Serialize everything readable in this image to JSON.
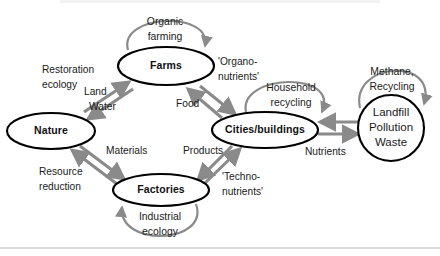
{
  "diagram": {
    "type": "cycle-flow-diagram",
    "colors": {
      "node_stroke": "#000000",
      "arrow_gray": "#8a8a8a",
      "loop_gray": "#8a8a8a",
      "text": "#1a1a1a",
      "background": "#ffffff",
      "rule": "#b5b5b5"
    },
    "nodes": [
      {
        "id": "nature",
        "label": "Nature",
        "shape": "ellipse",
        "bold": true,
        "cx": 51,
        "cy": 131,
        "rx": 44,
        "ry": 18
      },
      {
        "id": "farms",
        "label": "Farms",
        "shape": "ellipse",
        "bold": true,
        "cx": 166,
        "cy": 66,
        "rx": 48,
        "ry": 19
      },
      {
        "id": "cities",
        "label": "Cities/buildings",
        "shape": "ellipse",
        "bold": true,
        "cx": 265,
        "cy": 130,
        "rx": 53,
        "ry": 18
      },
      {
        "id": "factories",
        "label": "Factories",
        "shape": "ellipse",
        "bold": true,
        "cx": 161,
        "cy": 190,
        "rx": 48,
        "ry": 16
      },
      {
        "id": "landfill",
        "label": "Landfill Pollution Waste",
        "shape": "circle",
        "bold": false,
        "cx": 391,
        "cy": 128,
        "rx": 34,
        "ry": 30,
        "lines": [
          "Landfill",
          "Pollution",
          "Waste"
        ]
      }
    ],
    "self_loops": [
      {
        "id": "organic-farming",
        "target": "farms",
        "lines": [
          "Organic",
          "farming"
        ],
        "cx": 165,
        "cy": 27
      },
      {
        "id": "household-recycling",
        "target": "cities",
        "lines": [
          "Household",
          "recycling"
        ],
        "cx": 290,
        "cy": 93
      },
      {
        "id": "methane-recycling",
        "target": "landfill",
        "lines": [
          "Methane,",
          "Recycling"
        ],
        "cx": 390,
        "cy": 78
      },
      {
        "id": "industrial-ecology",
        "target": "factories",
        "lines": [
          "Industrial",
          "ecology"
        ],
        "cx": 160,
        "cy": 222
      }
    ],
    "edges": [
      {
        "id": "nature-farms",
        "from": "nature",
        "to": "farms",
        "direction": "both",
        "labels": [
          "Restoration ecology",
          "Land",
          "Water"
        ]
      },
      {
        "id": "farms-cities",
        "from": "farms",
        "to": "cities",
        "direction": "both",
        "labels": [
          "'Organo-nutrients'",
          "Food"
        ]
      },
      {
        "id": "nature-factories",
        "from": "nature",
        "to": "factories",
        "direction": "both",
        "labels": [
          "Materials",
          "Resource reduction"
        ]
      },
      {
        "id": "factories-cities",
        "from": "factories",
        "to": "cities",
        "direction": "both",
        "labels": [
          "Products",
          "'Techno-nutrients'"
        ]
      },
      {
        "id": "cities-landfill",
        "from": "cities",
        "to": "landfill",
        "direction": "both",
        "labels": [
          "Nutrients"
        ]
      }
    ],
    "edge_labels": [
      {
        "id": "restoration-ecology",
        "lines": [
          "Restoration",
          "ecology"
        ],
        "x": 42,
        "y": 70,
        "anchor": "start"
      },
      {
        "id": "land",
        "lines": [
          "Land"
        ],
        "x": 82,
        "y": 89,
        "anchor": "start"
      },
      {
        "id": "water",
        "lines": [
          "Water"
        ],
        "x": 86,
        "y": 104,
        "anchor": "start"
      },
      {
        "id": "organo-nutrients",
        "lines": [
          "'Organo-",
          "nutrients'"
        ],
        "x": 219,
        "y": 64,
        "anchor": "start"
      },
      {
        "id": "food",
        "lines": [
          "Food"
        ],
        "x": 178,
        "y": 104,
        "anchor": "start"
      },
      {
        "id": "materials",
        "lines": [
          "Materials"
        ],
        "x": 108,
        "y": 151,
        "anchor": "start"
      },
      {
        "id": "resource-reduction",
        "lines": [
          "Resource",
          "reduction"
        ],
        "x": 41,
        "y": 173,
        "anchor": "start"
      },
      {
        "id": "products",
        "lines": [
          "Products"
        ],
        "x": 184,
        "y": 151,
        "anchor": "start"
      },
      {
        "id": "techno-nutrients",
        "lines": [
          "'Techno-",
          "nutrients'"
        ],
        "x": 224,
        "y": 178,
        "anchor": "start"
      },
      {
        "id": "nutrients",
        "lines": [
          "Nutrients"
        ],
        "x": 307,
        "y": 152,
        "anchor": "start"
      }
    ],
    "footer_rule": {
      "y": 248
    }
  }
}
